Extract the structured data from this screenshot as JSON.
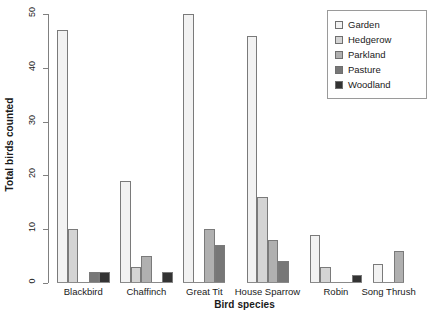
{
  "chart_data": {
    "type": "bar",
    "title": "",
    "xlabel": "Bird species",
    "ylabel": "Total birds counted",
    "categories": [
      "Blackbird",
      "Chaffinch",
      "Great Tit",
      "House Sparrow",
      "Robin",
      "Song Thrush"
    ],
    "ylim": [
      0,
      50
    ],
    "yticks": [
      0,
      10,
      20,
      30,
      40,
      50
    ],
    "ytick_labels": [
      "0",
      "10",
      "20",
      "30",
      "40",
      "50"
    ],
    "grid": false,
    "legend_position": "top-right",
    "series": [
      {
        "name": "Garden",
        "color": "#f2f2f2",
        "values": [
          47,
          19,
          50,
          46,
          9,
          3.5
        ]
      },
      {
        "name": "Hedgerow",
        "color": "#d4d4d4",
        "values": [
          10,
          3,
          0,
          16,
          3,
          0
        ]
      },
      {
        "name": "Parkland",
        "color": "#b0b0b0",
        "values": [
          0,
          5,
          10,
          8,
          0,
          6
        ]
      },
      {
        "name": "Pasture",
        "color": "#777777",
        "values": [
          2,
          0,
          7,
          4,
          0,
          0
        ]
      },
      {
        "name": "Woodland",
        "color": "#333333",
        "values": [
          2,
          2,
          0,
          0,
          1.5,
          0
        ]
      }
    ]
  },
  "legend": {
    "items": [
      {
        "label": "Garden"
      },
      {
        "label": "Hedgerow"
      },
      {
        "label": "Parkland"
      },
      {
        "label": "Pasture"
      },
      {
        "label": "Woodland"
      }
    ]
  }
}
